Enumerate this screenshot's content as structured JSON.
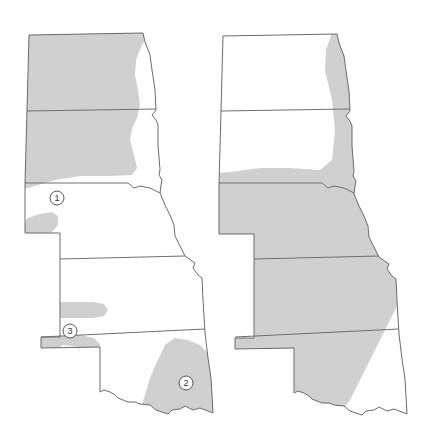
{
  "figure": {
    "colors": {
      "shade": "#d0d0d0",
      "outline": "#6a6a6a",
      "background": "#ffffff"
    }
  },
  "left_map": {
    "states": [
      "North Dakota",
      "South Dakota",
      "Nebraska",
      "Kansas",
      "Oklahoma"
    ],
    "markers": [
      {
        "label": "1",
        "x": 57,
        "y": 198
      },
      {
        "label": "2",
        "x": 186,
        "y": 383
      },
      {
        "label": "3",
        "x": 70,
        "y": 331
      }
    ],
    "shaded_regions": [
      "Western and central North Dakota",
      "Western and central South Dakota",
      "Southwest Nebraska strip",
      "Western Kansas strip",
      "Oklahoma panhandle strip",
      "Southeastern Oklahoma"
    ]
  },
  "right_map": {
    "states": [
      "North Dakota",
      "South Dakota",
      "Nebraska",
      "Kansas",
      "Oklahoma"
    ],
    "markers": [],
    "shaded_regions": [
      "Eastern North Dakota band",
      "Eastern South Dakota band",
      "All of Nebraska",
      "All of Kansas",
      "Western Oklahoma including panhandle"
    ]
  }
}
